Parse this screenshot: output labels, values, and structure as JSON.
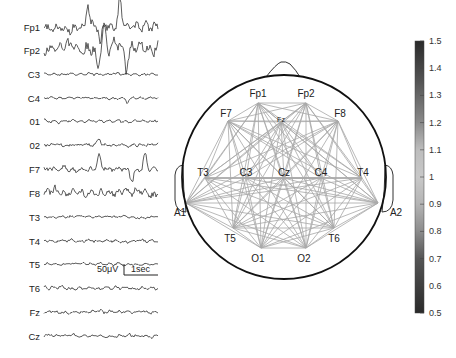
{
  "eeg_panel": {
    "channels": [
      {
        "label": "Fp1",
        "y": 27,
        "amp": 7,
        "seed": 3,
        "spikes": [
          [
            88,
            -22
          ],
          [
            100,
            18
          ],
          [
            120,
            -25
          ]
        ]
      },
      {
        "label": "Fp2",
        "y": 50,
        "amp": 10,
        "seed": 7,
        "spikes": [
          [
            98,
            18
          ],
          [
            104,
            -20
          ],
          [
            126,
            20
          ]
        ]
      },
      {
        "label": "C3",
        "y": 74,
        "amp": 1.8,
        "seed": 11,
        "spikes": []
      },
      {
        "label": "C4",
        "y": 98,
        "amp": 1.8,
        "seed": 13,
        "spikes": [
          [
            127,
            4
          ]
        ]
      },
      {
        "label": "01",
        "y": 121,
        "amp": 2.2,
        "seed": 17,
        "spikes": []
      },
      {
        "label": "02",
        "y": 145,
        "amp": 2.4,
        "seed": 19,
        "spikes": [
          [
            99,
            -6
          ]
        ]
      },
      {
        "label": "F7",
        "y": 169,
        "amp": 4,
        "seed": 23,
        "spikes": [
          [
            99,
            -14
          ],
          [
            132,
            12
          ],
          [
            145,
            -16
          ]
        ]
      },
      {
        "label": "F8",
        "y": 193,
        "amp": 6,
        "seed": 29,
        "spikes": []
      },
      {
        "label": "T3",
        "y": 217,
        "amp": 1.8,
        "seed": 31,
        "spikes": []
      },
      {
        "label": "T4",
        "y": 241,
        "amp": 2.2,
        "seed": 37,
        "spikes": []
      },
      {
        "label": "T5",
        "y": 264,
        "amp": 2,
        "seed": 41,
        "spikes": []
      },
      {
        "label": "T6",
        "y": 288,
        "amp": 2.6,
        "seed": 43,
        "spikes": []
      },
      {
        "label": "Fz",
        "y": 312,
        "amp": 2.4,
        "seed": 47,
        "spikes": []
      },
      {
        "label": "Cz",
        "y": 336,
        "amp": 2.4,
        "seed": 53,
        "spikes": []
      }
    ],
    "scale_bar": {
      "amplitude_label": "50μV",
      "time_label": "1sec"
    }
  },
  "head_map": {
    "center": [
      284,
      177
    ],
    "radius": 102,
    "electrodes": [
      {
        "name": "Fp1",
        "x": 258,
        "y": 103,
        "lx": 258,
        "ly": 97
      },
      {
        "name": "Fp2",
        "x": 306,
        "y": 103,
        "lx": 306,
        "ly": 97
      },
      {
        "name": "F7",
        "x": 228,
        "y": 121,
        "lx": 226,
        "ly": 117
      },
      {
        "name": "F8",
        "x": 338,
        "y": 121,
        "lx": 340,
        "ly": 117
      },
      {
        "name": "Fz",
        "x": 281,
        "y": 122,
        "lx": 281,
        "ly": 122
      },
      {
        "name": "T3",
        "x": 205,
        "y": 178,
        "lx": 203,
        "ly": 176
      },
      {
        "name": "C3",
        "x": 246,
        "y": 178,
        "lx": 246,
        "ly": 176
      },
      {
        "name": "Cz",
        "x": 284,
        "y": 178,
        "lx": 284,
        "ly": 176
      },
      {
        "name": "C4",
        "x": 321,
        "y": 178,
        "lx": 321,
        "ly": 176
      },
      {
        "name": "T4",
        "x": 362,
        "y": 178,
        "lx": 363,
        "ly": 176
      },
      {
        "name": "A1",
        "x": 186,
        "y": 203,
        "lx": 180,
        "ly": 216
      },
      {
        "name": "A2",
        "x": 378,
        "y": 203,
        "lx": 396,
        "ly": 216
      },
      {
        "name": "T5",
        "x": 233,
        "y": 228,
        "lx": 230,
        "ly": 242
      },
      {
        "name": "T6",
        "x": 334,
        "y": 228,
        "lx": 334,
        "ly": 242
      },
      {
        "name": "O1",
        "x": 261,
        "y": 248,
        "lx": 258,
        "ly": 262
      },
      {
        "name": "O2",
        "x": 306,
        "y": 248,
        "lx": 304,
        "ly": 262
      }
    ],
    "connectivity": "all-pairs"
  },
  "colorbar": {
    "ticks": [
      "1.5",
      "1.4",
      "1.3",
      "1.2",
      "1.1",
      "1",
      "0.9",
      "0.8",
      "0.7",
      "0.6",
      "0.5"
    ],
    "min": 0.5,
    "max": 1.5,
    "stops": [
      {
        "offset": 0,
        "color": "#2a2a2a"
      },
      {
        "offset": 0.15,
        "color": "#555555"
      },
      {
        "offset": 0.3,
        "color": "#8a8a8a"
      },
      {
        "offset": 0.4,
        "color": "#bdbdbd"
      },
      {
        "offset": 0.5,
        "color": "#c8c8c8"
      },
      {
        "offset": 0.6,
        "color": "#b4b4b4"
      },
      {
        "offset": 0.7,
        "color": "#8c8c8c"
      },
      {
        "offset": 0.8,
        "color": "#555555"
      },
      {
        "offset": 1,
        "color": "#2a2a2a"
      }
    ]
  }
}
